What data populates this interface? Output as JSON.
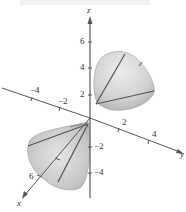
{
  "figure": {
    "type": "3d-surface-plot",
    "colors": {
      "axis": "#555555",
      "surface_light": "#e6e6e6",
      "surface_mid": "#c8c8c8",
      "surface_dark": "#a9a9a9",
      "ruling": "#555555",
      "text": "#333333"
    }
  },
  "axes": {
    "x": {
      "label": "x",
      "ticks": [
        "4",
        "6"
      ]
    },
    "y": {
      "label": "y",
      "ticks": [
        "-4",
        "-2",
        "2",
        "4"
      ]
    },
    "z": {
      "label": "z",
      "ticks": [
        "6",
        "4",
        "2",
        "-2",
        "-4"
      ]
    }
  },
  "labels": {
    "z_axis": "z",
    "y_axis": "y",
    "x_axis": "x",
    "z6": "6",
    "z4": "4",
    "z2": "2",
    "zm2": "−2",
    "zm4": "−4",
    "ym4": "−4",
    "ym2": "−2",
    "y2": "2",
    "y4": "4",
    "x6": "6"
  }
}
